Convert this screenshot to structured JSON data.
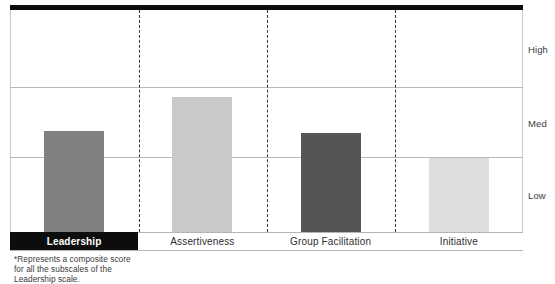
{
  "chart_data": {
    "type": "bar",
    "title": "",
    "xlabel": "",
    "ylabel": "",
    "categories": [
      "Leadership",
      "Assertiveness",
      "Group Facilitation",
      "Initiative"
    ],
    "values": [
      1.44,
      1.93,
      1.41,
      1.0
    ],
    "ytick_labels": [
      "Low",
      "Med",
      "High"
    ],
    "ytick_values": [
      1,
      2,
      3
    ],
    "ylim": [
      0,
      3
    ],
    "grid": true,
    "legend": "none",
    "highlighted_category": "Leadership",
    "bar_colors": [
      "#808080",
      "#c9c9c9",
      "#555555",
      "#dedede"
    ],
    "series": [
      {
        "name": "Competency score",
        "points": [
          {
            "category": "Leadership",
            "value": 1.44,
            "level": "Low-to-Med",
            "color": "#808080",
            "bar_top_px": 131
          },
          {
            "category": "Assertiveness",
            "value": 1.93,
            "level": "Med",
            "color": "#c9c9c9",
            "bar_top_px": 97
          },
          {
            "category": "Group Facilitation",
            "value": 1.41,
            "level": "Low-to-Med",
            "color": "#555555",
            "bar_top_px": 133
          },
          {
            "category": "Initiative",
            "value": 1.0,
            "level": "Low",
            "color": "#dedede",
            "bar_top_px": 158
          }
        ]
      }
    ]
  },
  "axis": {
    "right_labels": {
      "high": "High",
      "med": "Med",
      "low": "Low"
    }
  },
  "categories": [
    {
      "label": "Leadership",
      "highlighted": true
    },
    {
      "label": "Assertiveness",
      "highlighted": false
    },
    {
      "label": "Group Facilitation",
      "highlighted": false
    },
    {
      "label": "Initiative",
      "highlighted": false
    }
  ],
  "footnote": {
    "line1": "*Represents a composite score",
    "line2": "for all the subscales of the",
    "line3": "Leadership scale."
  },
  "colors": {
    "rule": "#0d0d0d",
    "gridline": "#b9b9b9",
    "separator": "#3a3a3a",
    "highlight_bg": "#0d0d0d",
    "highlight_text": "#ffffff"
  }
}
